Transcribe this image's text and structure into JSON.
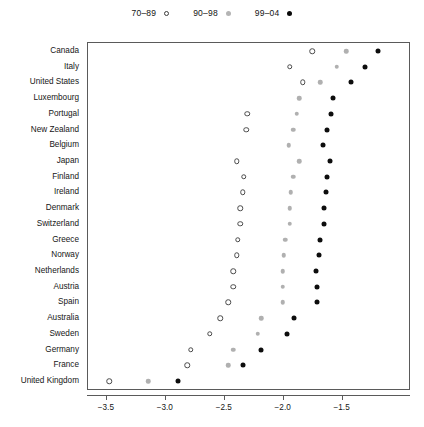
{
  "legend": {
    "entries": [
      {
        "label": "70–89",
        "style": "open",
        "color": "#3d3d3d"
      },
      {
        "label": "90–98",
        "style": "gray",
        "color": "#b4b4b4"
      },
      {
        "label": "99–04",
        "style": "black",
        "color": "#0a0a0a"
      }
    ]
  },
  "axis": {
    "x_ticks": [
      "−3.5",
      "−3.0",
      "−2.5",
      "−2.0",
      "−1.5"
    ],
    "x_tick_values": [
      -3.5,
      -3.0,
      -2.5,
      -2.0,
      -1.5
    ],
    "xlim": [
      -3.66,
      -0.92
    ]
  },
  "chart_data": {
    "type": "scatter",
    "title": "",
    "subtitle": "",
    "xlabel": "",
    "ylabel": "",
    "xlim": [
      -3.66,
      -0.92
    ],
    "xticks": [
      -3.5,
      -3.0,
      -2.5,
      -2.0,
      -1.5
    ],
    "xticklabels": [
      "−3.5",
      "−3.0",
      "−2.5",
      "−2.0",
      "−1.5"
    ],
    "grid": false,
    "legend_position": "top-center",
    "categories": [
      "Canada",
      "Italy",
      "United States",
      "Luxembourg",
      "Portugal",
      "New Zealand",
      "Belgium",
      "Japan",
      "Finland",
      "Ireland",
      "Denmark",
      "Switzerland",
      "Greece",
      "Norway",
      "Netherlands",
      "Austria",
      "Spain",
      "Australia",
      "Sweden",
      "Germany",
      "France",
      "United Kingdom"
    ],
    "series": [
      {
        "name": "70–89",
        "marker": "open-circle",
        "color": "#3d3d3d",
        "values": [
          -1.75,
          -1.94,
          -1.83,
          null,
          -2.3,
          -2.31,
          null,
          -2.39,
          -2.33,
          -2.34,
          -2.36,
          -2.36,
          -2.38,
          -2.39,
          -2.42,
          -2.42,
          -2.46,
          -2.53,
          -2.62,
          -2.78,
          -2.81,
          -3.47
        ]
      },
      {
        "name": "90–98",
        "marker": "filled-circle",
        "color": "#b4b4b4",
        "values": [
          -1.46,
          -1.54,
          -1.68,
          -1.86,
          -1.88,
          -1.91,
          -1.95,
          -1.86,
          -1.91,
          -1.93,
          -1.94,
          -1.94,
          -1.98,
          -1.99,
          -2.0,
          -2.0,
          -2.0,
          -2.18,
          -2.21,
          -2.42,
          -2.46,
          -3.14
        ]
      },
      {
        "name": "99–04",
        "marker": "filled-circle",
        "color": "#0a0a0a",
        "values": [
          -1.19,
          -1.3,
          -1.42,
          -1.57,
          -1.59,
          -1.62,
          -1.66,
          -1.6,
          -1.62,
          -1.63,
          -1.65,
          -1.65,
          -1.68,
          -1.69,
          -1.72,
          -1.71,
          -1.71,
          -1.9,
          -1.96,
          -2.18,
          -2.34,
          -2.89
        ]
      }
    ]
  }
}
